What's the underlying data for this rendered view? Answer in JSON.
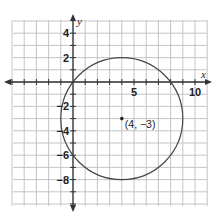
{
  "chart_data": {
    "type": "scatter",
    "title": "",
    "xlabel": "x",
    "ylabel": "y",
    "xlim": [
      -5,
      11
    ],
    "ylim": [
      -10,
      5
    ],
    "grid": true,
    "x_tick_labels": [
      {
        "value": 5,
        "label": "5"
      },
      {
        "value": 10,
        "label": "10"
      }
    ],
    "y_tick_labels": [
      {
        "value": 4,
        "label": "4"
      },
      {
        "value": 2,
        "label": "2"
      },
      {
        "value": -2,
        "label": "−2"
      },
      {
        "value": -4,
        "label": "−4"
      },
      {
        "value": -6,
        "label": "−6"
      },
      {
        "value": -8,
        "label": "−8"
      }
    ],
    "shapes": [
      {
        "type": "circle",
        "center": [
          4,
          -3
        ],
        "radius": 5
      }
    ],
    "points": [
      {
        "x": 4,
        "y": -3,
        "label": "(4, −3)"
      }
    ],
    "colors": {
      "grid": "#bdbdbd",
      "axis": "#333333",
      "curve": "#444444"
    }
  }
}
